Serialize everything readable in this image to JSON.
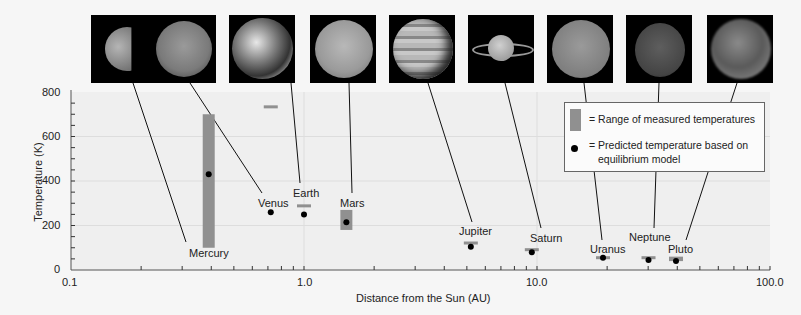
{
  "chart_data": {
    "type": "scatter",
    "title": "",
    "xlabel": "Distance from the Sun (AU)",
    "ylabel": "Temperature (K)",
    "xscale": "log",
    "xlim": [
      0.1,
      100.0
    ],
    "ylim": [
      0,
      800
    ],
    "x_ticks": [
      "0.1",
      "1.0",
      "10.0",
      "100.0"
    ],
    "y_ticks": [
      "0",
      "200",
      "400",
      "600",
      "800"
    ],
    "grid": true,
    "legend_position": "upper right",
    "legend": [
      {
        "marker": "gray-bar",
        "label": "= Range of measured temperatures"
      },
      {
        "marker": "black-dot",
        "label": "= Predicted temperature based on equilibrium model"
      }
    ],
    "series": [
      {
        "name": "Range of measured temperatures",
        "points": [
          {
            "planet": "Mercury",
            "x": 0.39,
            "low": 100,
            "high": 700
          },
          {
            "planet": "Venus",
            "x": 0.72,
            "low": 730,
            "high": 740
          },
          {
            "planet": "Earth",
            "x": 1.0,
            "low": 285,
            "high": 295
          },
          {
            "planet": "Mars",
            "x": 1.52,
            "low": 180,
            "high": 270
          },
          {
            "planet": "Jupiter",
            "x": 5.2,
            "low": 123,
            "high": 128
          },
          {
            "planet": "Saturn",
            "x": 9.5,
            "low": 93,
            "high": 98
          },
          {
            "planet": "Uranus",
            "x": 19.2,
            "low": 55,
            "high": 62
          },
          {
            "planet": "Neptune",
            "x": 30.1,
            "low": 58,
            "high": 62
          },
          {
            "planet": "Pluto",
            "x": 39.5,
            "low": 40,
            "high": 60
          }
        ]
      },
      {
        "name": "Predicted temperature based on equilibrium model",
        "points": [
          {
            "planet": "Mercury",
            "x": 0.39,
            "y": 430
          },
          {
            "planet": "Venus",
            "x": 0.72,
            "y": 260
          },
          {
            "planet": "Earth",
            "x": 1.0,
            "y": 250
          },
          {
            "planet": "Mars",
            "x": 1.52,
            "y": 215
          },
          {
            "planet": "Jupiter",
            "x": 5.2,
            "y": 105
          },
          {
            "planet": "Saturn",
            "x": 9.5,
            "y": 80
          },
          {
            "planet": "Uranus",
            "x": 19.2,
            "y": 55
          },
          {
            "planet": "Neptune",
            "x": 30.1,
            "y": 45
          },
          {
            "planet": "Pluto",
            "x": 39.5,
            "y": 40
          }
        ]
      }
    ]
  },
  "planets": [
    {
      "name": "Mercury",
      "img_x": 91,
      "lbl_x": 189,
      "lbl_y": 247
    },
    {
      "name": "Venus",
      "img_x": 150,
      "lbl_x": 258,
      "lbl_y": 197
    },
    {
      "name": "Earth",
      "img_x": 229,
      "lbl_x": 293,
      "lbl_y": 187
    },
    {
      "name": "Mars",
      "img_x": 310,
      "lbl_x": 340,
      "lbl_y": 197
    },
    {
      "name": "Jupiter",
      "img_x": 389,
      "lbl_x": 459,
      "lbl_y": 225
    },
    {
      "name": "Saturn",
      "img_x": 468,
      "lbl_x": 530,
      "lbl_y": 232
    },
    {
      "name": "Uranus",
      "img_x": 547,
      "lbl_x": 590,
      "lbl_y": 243
    },
    {
      "name": "Neptune",
      "img_x": 626,
      "lbl_x": 629,
      "lbl_y": 231
    },
    {
      "name": "Pluto",
      "img_x": 707,
      "lbl_x": 668,
      "lbl_y": 243
    }
  ],
  "axes": {
    "xlabel": "Distance from the Sun (AU)",
    "ylabel": "Temperature (K)",
    "x_ticks": [
      "0.1",
      "1.0",
      "10.0",
      "100.0"
    ],
    "y_ticks": [
      "0",
      "200",
      "400",
      "600",
      "800"
    ]
  },
  "legend": {
    "range_label": "= Range of measured temperatures",
    "predicted_label_1": "= Predicted temperature based on",
    "predicted_label_2": "equilibrium model"
  },
  "colors": {
    "bar": "#909090",
    "dot": "#000000",
    "grid": "#dddddd",
    "plot_bg": "#efefef"
  }
}
